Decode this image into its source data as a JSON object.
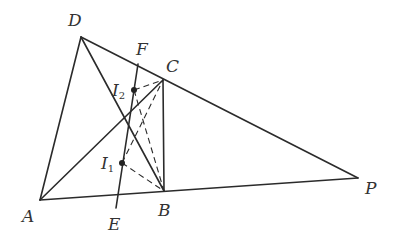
{
  "diagram": {
    "type": "geometry",
    "points": {
      "D": {
        "label": "D",
        "x": 81,
        "y": 37
      },
      "C": {
        "label": "C",
        "x": 163,
        "y": 80
      },
      "P": {
        "label": "P",
        "x": 358,
        "y": 178
      },
      "A": {
        "label": "A",
        "x": 40,
        "y": 200
      },
      "B": {
        "label": "B",
        "x": 164,
        "y": 191
      },
      "F": {
        "label": "F",
        "x": 138,
        "y": 64
      },
      "E": {
        "label": "E",
        "x": 116,
        "y": 208
      },
      "I1": {
        "label": "I",
        "subscript": "1",
        "x": 122,
        "y": 163
      },
      "I2": {
        "label": "I",
        "subscript": "2",
        "x": 134,
        "y": 90
      }
    },
    "labels": {
      "D": "D",
      "F": "F",
      "C": "C",
      "I": "I",
      "sub1": "1",
      "sub2": "2",
      "A": "A",
      "E": "E",
      "B": "B",
      "P": "P"
    },
    "solid_segments": [
      "DA",
      "DP",
      "AP",
      "DB",
      "AC",
      "CB",
      "EF"
    ],
    "dashed_segments": [
      "I2C",
      "I2B",
      "I1C",
      "I1B"
    ],
    "colors": {
      "stroke": "#2b2b2b",
      "text": "#333333",
      "background": "#ffffff"
    }
  }
}
